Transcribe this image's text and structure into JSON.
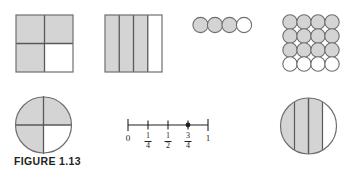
{
  "figure": {
    "caption": "FIGURE 1.13",
    "topic": "Representations of the fraction three fourths",
    "colors": {
      "shaded_fill": "#d4d4d4",
      "unshaded_fill": "#ffffff",
      "outline": "#6d6e71",
      "divider": "#58595b",
      "text": "#231f20",
      "background": "#ffffff"
    }
  },
  "models": {
    "square_quadrants": {
      "name": "square-quadrant-model",
      "total_parts": 4,
      "shaded_parts": 3,
      "fraction": "3/4",
      "cells": [
        {
          "row": 0,
          "col": 0,
          "shaded": true
        },
        {
          "row": 0,
          "col": 1,
          "shaded": true
        },
        {
          "row": 1,
          "col": 0,
          "shaded": true
        },
        {
          "row": 1,
          "col": 1,
          "shaded": false
        }
      ]
    },
    "square_strips": {
      "name": "square-vertical-strips-model",
      "total_parts": 4,
      "shaded_parts": 3,
      "fraction": "3/4",
      "strips": [
        {
          "index": 0,
          "shaded": true
        },
        {
          "index": 1,
          "shaded": true
        },
        {
          "index": 2,
          "shaded": true
        },
        {
          "index": 3,
          "shaded": false
        }
      ]
    },
    "circle_row": {
      "name": "circle-row-set-model",
      "total_parts": 4,
      "shaded_parts": 3,
      "fraction": "3/4",
      "circles": [
        {
          "index": 0,
          "shaded": true
        },
        {
          "index": 1,
          "shaded": true
        },
        {
          "index": 2,
          "shaded": true
        },
        {
          "index": 3,
          "shaded": false
        }
      ]
    },
    "circle_grid": {
      "name": "circle-grid-set-model",
      "rows": 4,
      "cols": 4,
      "total_parts": 16,
      "shaded_parts": 12,
      "fraction": "12/16",
      "shaded_rows": [
        0,
        1,
        2
      ],
      "unshaded_rows": [
        3
      ]
    },
    "circle_quadrants": {
      "name": "circle-quadrant-model",
      "total_parts": 4,
      "shaded_parts": 3,
      "fraction": "3/4",
      "sectors": [
        {
          "position": "top-left",
          "shaded": true
        },
        {
          "position": "top-right",
          "shaded": true
        },
        {
          "position": "bottom-left",
          "shaded": true
        },
        {
          "position": "bottom-right",
          "shaded": false
        }
      ]
    },
    "circle_strips": {
      "name": "circle-vertical-strips-model",
      "total_parts": 4,
      "shaded_parts": 3,
      "fraction": "3/4",
      "strips": [
        {
          "index": 0,
          "shaded": true
        },
        {
          "index": 1,
          "shaded": true
        },
        {
          "index": 2,
          "shaded": true
        },
        {
          "index": 3,
          "shaded": false
        }
      ]
    }
  },
  "number_line": {
    "name": "number-line-model",
    "start": 0,
    "end": 1,
    "point_value": "3/4",
    "ticks": [
      {
        "value": 0,
        "label_type": "integer",
        "label": "0",
        "whole": "0",
        "numerator": "",
        "denominator": "",
        "marked": false
      },
      {
        "value": 0.25,
        "label_type": "fraction",
        "label": "1/4",
        "whole": "",
        "numerator": "1",
        "denominator": "4",
        "marked": false
      },
      {
        "value": 0.5,
        "label_type": "fraction",
        "label": "1/2",
        "whole": "",
        "numerator": "1",
        "denominator": "2",
        "marked": false
      },
      {
        "value": 0.75,
        "label_type": "fraction",
        "label": "3/4",
        "whole": "",
        "numerator": "3",
        "denominator": "4",
        "marked": true
      },
      {
        "value": 1,
        "label_type": "integer",
        "label": "1",
        "whole": "1",
        "numerator": "",
        "denominator": "",
        "marked": false
      }
    ]
  }
}
